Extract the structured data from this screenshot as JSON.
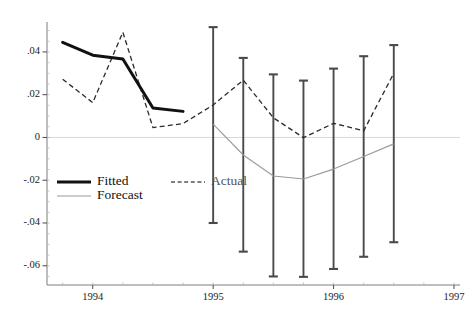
{
  "chart_data": {
    "type": "line",
    "title": "",
    "subtitle": "",
    "xlabel": "",
    "ylabel": "",
    "xlim": [
      1993.62,
      1997.05
    ],
    "ylim": [
      -0.069,
      0.054
    ],
    "grid": false,
    "zero_line": 0,
    "legend_position": "inside-lower-left",
    "x_ticks": [
      1994,
      1995,
      1996,
      1997
    ],
    "x_tick_labels": [
      "1994",
      "1995",
      "1996",
      "1997"
    ],
    "x_minor_tick_step": 0.25,
    "y_ticks": [
      0.04,
      0.02,
      0,
      -0.02,
      -0.04,
      -0.06
    ],
    "y_tick_labels": [
      ".04",
      ".02",
      "0",
      "-.02",
      "-.04",
      "-.06"
    ],
    "y_minor_tick_step": 0.005,
    "series": [
      {
        "name": "Fitted",
        "style": "solid-bold",
        "color": "#111111",
        "x": [
          1993.75,
          1994.0,
          1994.25,
          1994.5,
          1994.75
        ],
        "values": [
          0.0445,
          0.0385,
          0.0367,
          0.0138,
          0.0122
        ]
      },
      {
        "name": "Actual",
        "style": "dashed",
        "color": "#2b2b2b",
        "x": [
          1993.75,
          1994.0,
          1994.25,
          1994.5,
          1994.75,
          1995.0,
          1995.25,
          1995.5,
          1995.75,
          1996.0,
          1996.25,
          1996.5
        ],
        "values": [
          0.0272,
          0.0163,
          0.0492,
          0.0046,
          0.0065,
          0.0152,
          0.0268,
          0.0092,
          -0.0001,
          0.0066,
          0.0031,
          0.03
        ]
      },
      {
        "name": "Forecast",
        "style": "solid-thin",
        "color": "#9a9a9a",
        "x": [
          1995.0,
          1995.25,
          1995.5,
          1995.75,
          1996.0,
          1996.25,
          1996.5
        ],
        "values": [
          0.0062,
          -0.0082,
          -0.018,
          -0.0194,
          -0.0148,
          -0.0089,
          -0.003
        ]
      }
    ],
    "error_bars": {
      "name": "Forecast confidence interval",
      "color": "#4a4a4a",
      "cap": true,
      "x": [
        1995.0,
        1995.25,
        1995.5,
        1995.75,
        1996.0,
        1996.25,
        1996.5
      ],
      "upper": [
        0.0516,
        0.0372,
        0.0295,
        0.0266,
        0.0322,
        0.038,
        0.0432
      ],
      "lower": [
        -0.04,
        -0.0534,
        -0.065,
        -0.0652,
        -0.0615,
        -0.0558,
        -0.049
      ]
    },
    "legend": [
      {
        "label": "Fitted",
        "style": "solid-bold",
        "color": "#111111"
      },
      {
        "label": "Actual",
        "style": "dashed",
        "color": "#555555"
      },
      {
        "label": "Forecast",
        "style": "solid-thin",
        "color": "#9a9a9a"
      }
    ]
  }
}
